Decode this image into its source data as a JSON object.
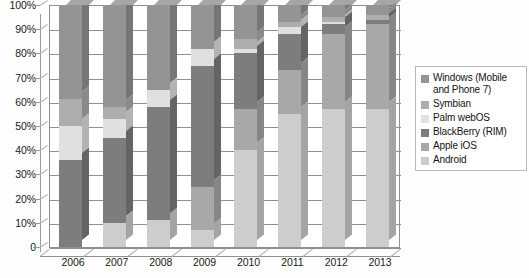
{
  "chart_data": {
    "type": "bar",
    "subtype": "stacked-100-percent-3d",
    "title": "",
    "subtitle": "",
    "xlabel": "",
    "ylabel": "",
    "categories": [
      "2006",
      "2007",
      "2008",
      "2009",
      "2010",
      "2011",
      "2012",
      "2013"
    ],
    "ylim": [
      0,
      100
    ],
    "yticks": [
      0,
      10,
      20,
      30,
      40,
      50,
      60,
      70,
      80,
      90,
      100
    ],
    "ytick_labels": [
      "0",
      "10%",
      "20%",
      "30%",
      "40%",
      "50%",
      "60%",
      "70%",
      "80%",
      "90%",
      "100%"
    ],
    "grid": true,
    "grid_axis": "y",
    "legend_position": "right",
    "stack_order_bottom_to_top": [
      "Android",
      "Apple iOS",
      "BlackBerry (RIM)",
      "Palm webOS",
      "Symbian",
      "Windows (Mobile and Phone 7)"
    ],
    "series": [
      {
        "name": "Android",
        "color": "#cdcdcd",
        "values": [
          0,
          10,
          11,
          7,
          40,
          55,
          57,
          57
        ]
      },
      {
        "name": "Apple iOS",
        "color": "#a8a8a8",
        "values": [
          0,
          0,
          0,
          18,
          17,
          18,
          31,
          35
        ]
      },
      {
        "name": "BlackBerry (RIM)",
        "color": "#7d7d7d",
        "values": [
          36,
          35,
          47,
          50,
          23,
          15,
          4,
          2
        ]
      },
      {
        "name": "Palm webOS",
        "color": "#e0e0e0",
        "values": [
          14,
          8,
          7,
          7,
          2,
          3,
          1,
          0
        ]
      },
      {
        "name": "Symbian",
        "color": "#adadad",
        "values": [
          11,
          5,
          0,
          0,
          4,
          2,
          2,
          2
        ]
      },
      {
        "name": "Windows (Mobile and Phone 7)",
        "color": "#949494",
        "values": [
          39,
          42,
          35,
          18,
          14,
          7,
          5,
          4
        ]
      }
    ]
  },
  "legend": {
    "items": [
      {
        "label": "Windows (Mobile and Phone 7)",
        "color": "#949494"
      },
      {
        "label": "Symbian",
        "color": "#adadad"
      },
      {
        "label": "Palm webOS",
        "color": "#e0e0e0"
      },
      {
        "label": "BlackBerry (RIM)",
        "color": "#7d7d7d"
      },
      {
        "label": "Apple iOS",
        "color": "#a8a8a8"
      },
      {
        "label": "Android",
        "color": "#cdcdcd"
      }
    ]
  },
  "colors": {
    "axis": "#8f8f8f",
    "text": "#1a1a1a",
    "plot_background": "#ffffff",
    "page_background": "#ffffff",
    "legend_border": "#b9b9b9"
  }
}
